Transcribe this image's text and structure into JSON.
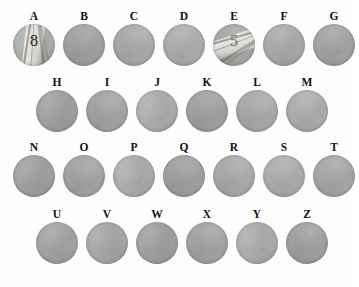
{
  "figure": {
    "name": "specimen-plate",
    "background_color": "#fdfdfd",
    "disc_color": "#a9a9a9",
    "label_color": "#121212",
    "disc_diameter_px": 42,
    "total_specimens": 26
  },
  "rows": [
    {
      "row_index": 1,
      "left_px": 13,
      "top_px": 10,
      "gap_px": 8,
      "count": 7,
      "specimens": [
        {
          "label": "A",
          "marked": true,
          "digit": "8",
          "digit_faint": false
        },
        {
          "label": "B",
          "marked": false,
          "digit": "",
          "digit_faint": false
        },
        {
          "label": "C",
          "marked": false,
          "digit": "",
          "digit_faint": false
        },
        {
          "label": "D",
          "marked": false,
          "digit": "",
          "digit_faint": false
        },
        {
          "label": "E",
          "marked": true,
          "digit": "5",
          "digit_faint": true
        },
        {
          "label": "F",
          "marked": false,
          "digit": "",
          "digit_faint": false
        },
        {
          "label": "G",
          "marked": false,
          "digit": "",
          "digit_faint": false
        }
      ]
    },
    {
      "row_index": 2,
      "left_px": 36,
      "top_px": 76,
      "gap_px": 8,
      "count": 6,
      "specimens": [
        {
          "label": "H",
          "marked": false,
          "digit": "",
          "digit_faint": false
        },
        {
          "label": "I",
          "marked": false,
          "digit": "",
          "digit_faint": false
        },
        {
          "label": "J",
          "marked": false,
          "digit": "",
          "digit_faint": false
        },
        {
          "label": "K",
          "marked": false,
          "digit": "",
          "digit_faint": false
        },
        {
          "label": "L",
          "marked": false,
          "digit": "",
          "digit_faint": false
        },
        {
          "label": "M",
          "marked": false,
          "digit": "",
          "digit_faint": false
        }
      ]
    },
    {
      "row_index": 3,
      "left_px": 13,
      "top_px": 141,
      "gap_px": 8,
      "count": 7,
      "specimens": [
        {
          "label": "N",
          "marked": false,
          "digit": "",
          "digit_faint": false
        },
        {
          "label": "O",
          "marked": false,
          "digit": "",
          "digit_faint": false
        },
        {
          "label": "P",
          "marked": false,
          "digit": "",
          "digit_faint": false
        },
        {
          "label": "Q",
          "marked": false,
          "digit": "",
          "digit_faint": false
        },
        {
          "label": "R",
          "marked": false,
          "digit": "",
          "digit_faint": false
        },
        {
          "label": "S",
          "marked": false,
          "digit": "",
          "digit_faint": false
        },
        {
          "label": "T",
          "marked": false,
          "digit": "",
          "digit_faint": false
        }
      ]
    },
    {
      "row_index": 4,
      "left_px": 36,
      "top_px": 208,
      "gap_px": 8,
      "count": 6,
      "specimens": [
        {
          "label": "U",
          "marked": false,
          "digit": "",
          "digit_faint": false
        },
        {
          "label": "V",
          "marked": false,
          "digit": "",
          "digit_faint": false
        },
        {
          "label": "W",
          "marked": false,
          "digit": "",
          "digit_faint": false
        },
        {
          "label": "X",
          "marked": false,
          "digit": "",
          "digit_faint": false
        },
        {
          "label": "Y",
          "marked": false,
          "digit": "",
          "digit_faint": false
        },
        {
          "label": "Z",
          "marked": false,
          "digit": "",
          "digit_faint": false
        }
      ]
    }
  ]
}
